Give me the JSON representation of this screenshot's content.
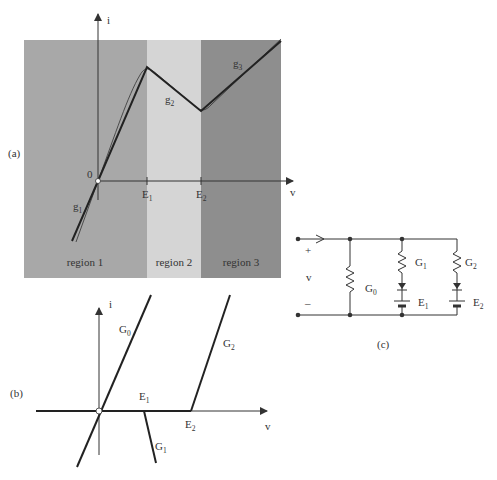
{
  "panel_a": {
    "label": "(a)",
    "axis_i": "i",
    "axis_v": "v",
    "origin": "0",
    "ticks": [
      {
        "base": "E",
        "sub": "1"
      },
      {
        "base": "E",
        "sub": "2"
      }
    ],
    "segments": [
      {
        "base": "g",
        "sub": "1"
      },
      {
        "base": "g",
        "sub": "2"
      },
      {
        "base": "g",
        "sub": "3"
      }
    ],
    "regions": [
      {
        "label": "region 1",
        "color": "#a8a8a8"
      },
      {
        "label": "region 2",
        "color": "#d5d5d5"
      },
      {
        "label": "region 3",
        "color": "#8e8e8e"
      }
    ]
  },
  "panel_b": {
    "label": "(b)",
    "axis_i": "i",
    "axis_v": "v",
    "lines": [
      {
        "base": "G",
        "sub": "0"
      },
      {
        "base": "G",
        "sub": "1"
      },
      {
        "base": "G",
        "sub": "2"
      }
    ],
    "points": [
      {
        "base": "E",
        "sub": "1"
      },
      {
        "base": "E",
        "sub": "2"
      }
    ]
  },
  "panel_c": {
    "label": "(c)",
    "plus": "+",
    "minus": "–",
    "voltage": "v",
    "components": [
      {
        "base": "G",
        "sub": "0"
      },
      {
        "base": "G",
        "sub": "1"
      },
      {
        "base": "E",
        "sub": "1"
      },
      {
        "base": "G",
        "sub": "2"
      },
      {
        "base": "E",
        "sub": "2"
      }
    ]
  }
}
